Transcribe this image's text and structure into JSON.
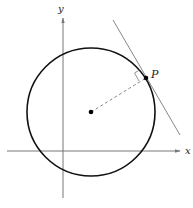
{
  "diagram": {
    "type": "geometry",
    "axes": {
      "x_label": "x",
      "y_label": "y"
    },
    "point_label": "P",
    "colors": {
      "circle": "#111111",
      "axes": "#777777",
      "tangent": "#777777",
      "radius": "#888888",
      "points": "#000000"
    }
  }
}
